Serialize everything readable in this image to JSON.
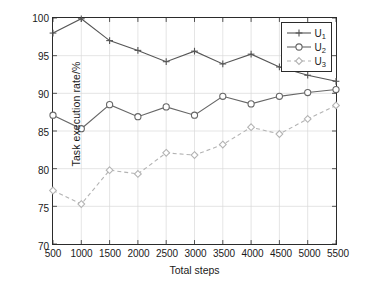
{
  "chart_data": {
    "type": "line",
    "title": "",
    "xlabel": "Total steps",
    "ylabel": "Task execution rate/%",
    "xlim": [
      500,
      5500
    ],
    "ylim": [
      70,
      100
    ],
    "xticks": [
      500,
      1000,
      1500,
      2000,
      2500,
      3000,
      3500,
      4000,
      4500,
      5000,
      5500
    ],
    "yticks": [
      70,
      75,
      80,
      85,
      90,
      95,
      100
    ],
    "grid": true,
    "legend_position": "top-right",
    "x": [
      500,
      1000,
      1500,
      2000,
      2500,
      3000,
      3500,
      4000,
      4500,
      5000,
      5500
    ],
    "series": [
      {
        "name": "U1",
        "label": "U",
        "subscript": "1",
        "marker": "plus",
        "linestyle": "solid",
        "color": "#555555",
        "values": [
          98.0,
          99.9,
          97.0,
          95.7,
          94.2,
          95.6,
          93.9,
          95.2,
          93.5,
          92.4,
          91.6
        ]
      },
      {
        "name": "U2",
        "label": "U",
        "subscript": "2",
        "marker": "circle",
        "linestyle": "solid",
        "color": "#666666",
        "values": [
          87.1,
          85.3,
          88.5,
          86.9,
          88.2,
          87.1,
          89.6,
          88.6,
          89.6,
          90.1,
          90.5
        ]
      },
      {
        "name": "U3",
        "label": "U",
        "subscript": "3",
        "marker": "diamond",
        "linestyle": "dashed",
        "color": "#b3b3b3",
        "values": [
          77.1,
          75.3,
          79.8,
          79.3,
          82.1,
          81.8,
          83.2,
          85.5,
          84.6,
          86.6,
          88.4
        ]
      }
    ]
  },
  "axes": {
    "ylabel": "Task execution rate/%",
    "xlabel": "Total steps",
    "ytick_labels": [
      "70",
      "75",
      "80",
      "85",
      "90",
      "95",
      "100"
    ],
    "xtick_labels": [
      "500",
      "1000",
      "1500",
      "2000",
      "2500",
      "3000",
      "3500",
      "4000",
      "4500",
      "5000",
      "5500"
    ]
  },
  "legend": {
    "entries": [
      {
        "label": "U",
        "subscript": "1"
      },
      {
        "label": "U",
        "subscript": "2"
      },
      {
        "label": "U",
        "subscript": "3"
      }
    ]
  },
  "colors": {
    "axis": "#2b2b2b",
    "grid": "#d9d9d9",
    "series1": "#555555",
    "series2": "#666666",
    "series3": "#b3b3b3",
    "background": "#ffffff"
  }
}
